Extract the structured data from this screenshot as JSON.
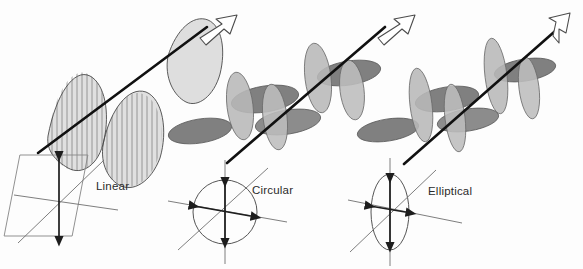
{
  "figure": {
    "background_color": "#fdfdfd",
    "width": 583,
    "height": 269
  },
  "colors": {
    "wave_dark_gray": "#808080",
    "wave_light_gray": "#b8b8b8",
    "propagation_axis": "#111111",
    "field_arrow": "#1d1d1d",
    "outline": "#555555",
    "label_text": "#2b2b2b",
    "hollow_arrow_fill": "#ffffff"
  },
  "panels": [
    {
      "id": "linear",
      "label": "Linear",
      "label_x": 96,
      "label_y": 190,
      "cross_section_shape": "parallelogram",
      "wave_style": "hatched-sinusoid",
      "wave_fill": "#b0b0b0",
      "field_arrows": [
        "vertical-double-headed"
      ],
      "propagation_arrow": "hollow-arrow-up-right",
      "description": "Single plane sinusoid with vertical hatching; square cross-section frame with vertical double arrow"
    },
    {
      "id": "circular",
      "label": "Circular",
      "label_x": 252,
      "label_y": 194,
      "cross_section_shape": "circle",
      "wave_style": "two-orthogonal-lobed-waves",
      "wave_fill_primary": "#808080",
      "wave_fill_secondary": "#b8b8b8",
      "field_arrows": [
        "vertical-double-headed",
        "horizontal-double-headed"
      ],
      "propagation_arrow": "hollow-arrow-up-right",
      "description": "Two equal-amplitude orthogonal waves 90 degrees out of phase; circular cross-section"
    },
    {
      "id": "elliptical",
      "label": "Elliptical",
      "label_x": 428,
      "label_y": 195,
      "cross_section_shape": "ellipse-tall",
      "wave_style": "two-orthogonal-lobed-waves",
      "wave_fill_primary": "#808080",
      "wave_fill_secondary": "#b8b8b8",
      "field_arrows": [
        "vertical-double-headed-long",
        "horizontal-double-headed-short"
      ],
      "propagation_arrow": "hollow-arrow-up-right",
      "description": "Two unequal-amplitude orthogonal waves; tall narrow elliptical cross-section"
    }
  ]
}
